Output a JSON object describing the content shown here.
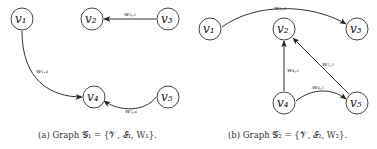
{
  "graphs": [
    {
      "id": "G1",
      "caption": "(a) Graph 𝒢₁ = {𝒱, ℰ₁, W₁}.",
      "nodes": [
        {
          "id": "v1",
          "label": "v₁",
          "x": 22,
          "y": 19
        },
        {
          "id": "v2",
          "label": "v₂",
          "x": 92,
          "y": 19
        },
        {
          "id": "v3",
          "label": "v₃",
          "x": 168,
          "y": 19
        },
        {
          "id": "v4",
          "label": "v₄",
          "x": 94,
          "y": 97
        },
        {
          "id": "v5",
          "label": "v₅",
          "x": 168,
          "y": 97
        }
      ],
      "edges": [
        {
          "from": "v3",
          "to": "v2",
          "label": "w₃,₂"
        },
        {
          "from": "v1",
          "to": "v4",
          "label": "w₁,₄"
        },
        {
          "from": "v5",
          "to": "v4",
          "label": "w₅,₄"
        }
      ]
    },
    {
      "id": "G2",
      "caption": "(b) Graph 𝒢₂ = {𝒱, ℰ₂, W₂}.",
      "nodes": [
        {
          "id": "v1",
          "label": "v₁",
          "x": 210,
          "y": 29
        },
        {
          "id": "v2",
          "label": "v₂",
          "x": 284,
          "y": 29
        },
        {
          "id": "v3",
          "label": "v₃",
          "x": 357,
          "y": 29
        },
        {
          "id": "v4",
          "label": "v₄",
          "x": 284,
          "y": 103
        },
        {
          "id": "v5",
          "label": "v₅",
          "x": 357,
          "y": 103
        }
      ],
      "edges": [
        {
          "from": "v1",
          "to": "v3",
          "label": "w₁,₃"
        },
        {
          "from": "v4",
          "to": "v2",
          "label": "w₄,₂"
        },
        {
          "from": "v5",
          "to": "v2",
          "label": "w₅,₂"
        },
        {
          "from": "v4",
          "to": "v5",
          "label": "w₄,₅"
        }
      ]
    }
  ]
}
